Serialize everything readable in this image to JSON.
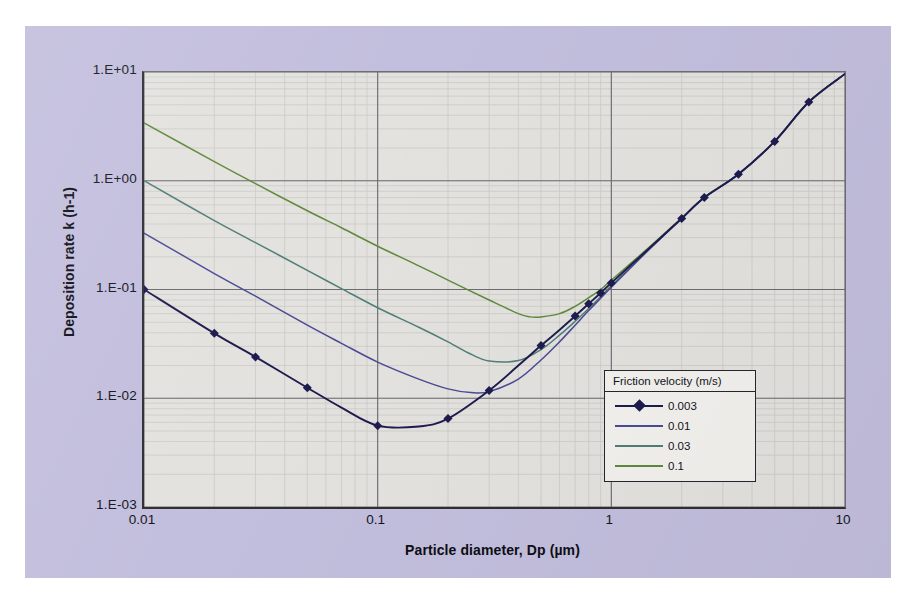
{
  "chart_data": {
    "type": "line",
    "title": "",
    "xlabel": "Particle diameter, Dp (µm)",
    "ylabel": "Deposition rate k (h-1)",
    "xscale": "log",
    "yscale": "log",
    "xlim": [
      0.01,
      10
    ],
    "ylim": [
      0.001,
      10
    ],
    "grid": true,
    "minor_grid": true,
    "legend_position": "inside-lower-right",
    "legend_title": "Friction velocity (m/s)",
    "x_tick_labels": [
      "0.01",
      "0.1",
      "1",
      "10"
    ],
    "x_tick_values": [
      0.01,
      0.1,
      1,
      10
    ],
    "y_tick_labels": [
      "1.E+01",
      "1.E+00",
      "1.E-01",
      "1.E-02",
      "1.E-03"
    ],
    "y_tick_values": [
      10,
      1,
      0.1,
      0.01,
      0.001
    ],
    "series": [
      {
        "name": "0.003",
        "color": "#1e1b4e",
        "marker": "diamond",
        "marker_size": 9,
        "x": [
          0.01,
          0.02,
          0.03,
          0.05,
          0.07,
          0.1,
          0.15,
          0.2,
          0.3,
          0.4,
          0.5,
          0.6,
          0.7,
          0.8,
          0.9,
          1.0,
          1.5,
          2.0,
          2.5,
          3.5,
          5.0,
          7.0,
          10.0
        ],
        "y": [
          0.1,
          0.0395,
          0.024,
          0.0125,
          0.0082,
          0.0056,
          0.0055,
          0.0065,
          0.0118,
          0.02,
          0.0305,
          0.0425,
          0.057,
          0.074,
          0.093,
          0.115,
          0.255,
          0.45,
          0.7,
          1.15,
          2.3,
          5.3,
          9.6
        ],
        "marker_x": [
          0.01,
          0.02,
          0.03,
          0.05,
          0.1,
          0.2,
          0.3,
          0.5,
          0.7,
          0.8,
          0.9,
          1.0,
          2.0,
          2.5,
          3.5,
          5.0,
          7.0
        ],
        "marker_y": [
          0.1,
          0.0395,
          0.024,
          0.0125,
          0.0056,
          0.0065,
          0.0118,
          0.0305,
          0.057,
          0.074,
          0.093,
          0.115,
          0.45,
          0.7,
          1.15,
          2.3,
          5.3
        ]
      },
      {
        "name": "0.01",
        "color": "#4a4a97",
        "marker": "none",
        "x": [
          0.01,
          0.02,
          0.03,
          0.05,
          0.07,
          0.1,
          0.15,
          0.2,
          0.25,
          0.3,
          0.4,
          0.5,
          0.6,
          0.7,
          0.8,
          0.9,
          1.0,
          1.5,
          2.0,
          2.5,
          3.5,
          5.0,
          7.0,
          10.0
        ],
        "y": [
          0.33,
          0.14,
          0.087,
          0.047,
          0.032,
          0.0215,
          0.015,
          0.0122,
          0.0113,
          0.0115,
          0.015,
          0.0225,
          0.033,
          0.047,
          0.064,
          0.083,
          0.105,
          0.25,
          0.45,
          0.7,
          1.15,
          2.3,
          5.3,
          9.6
        ]
      },
      {
        "name": "0.03",
        "color": "#4f7f78",
        "marker": "none",
        "x": [
          0.01,
          0.02,
          0.03,
          0.05,
          0.07,
          0.1,
          0.15,
          0.2,
          0.25,
          0.3,
          0.4,
          0.5,
          0.6,
          0.7,
          0.8,
          0.9,
          1.0,
          1.5,
          2.0,
          2.5,
          3.5,
          5.0,
          7.0,
          10.0
        ],
        "y": [
          1.0,
          0.43,
          0.27,
          0.15,
          0.102,
          0.068,
          0.045,
          0.033,
          0.0255,
          0.022,
          0.0222,
          0.028,
          0.038,
          0.051,
          0.067,
          0.086,
          0.108,
          0.25,
          0.45,
          0.7,
          1.15,
          2.3,
          5.3,
          9.6
        ]
      },
      {
        "name": "0.1",
        "color": "#5f8a3c",
        "marker": "none",
        "x": [
          0.01,
          0.02,
          0.03,
          0.05,
          0.07,
          0.1,
          0.15,
          0.2,
          0.3,
          0.4,
          0.45,
          0.5,
          0.6,
          0.7,
          0.8,
          0.9,
          1.0,
          1.5,
          2.0,
          2.5,
          3.5,
          5.0,
          7.0,
          10.0
        ],
        "y": [
          3.4,
          1.5,
          0.94,
          0.53,
          0.37,
          0.25,
          0.165,
          0.122,
          0.08,
          0.06,
          0.056,
          0.056,
          0.06,
          0.07,
          0.084,
          0.1,
          0.122,
          0.26,
          0.455,
          0.705,
          1.15,
          2.3,
          5.3,
          9.6
        ]
      }
    ]
  },
  "legend": {
    "title": "Friction velocity (m/s)",
    "entries": [
      {
        "label": "0.003",
        "color": "#1e1b4e",
        "marker": true
      },
      {
        "label": "0.01",
        "color": "#4a4a97",
        "marker": false
      },
      {
        "label": "0.03",
        "color": "#4f7f78",
        "marker": false
      },
      {
        "label": "0.1",
        "color": "#5f8a3c",
        "marker": false
      }
    ]
  },
  "axes": {
    "x_title": "Particle diameter, Dp (µm)",
    "y_title": "Deposition rate k (h-1)",
    "y_ticks": [
      "1.E+01",
      "1.E+00",
      "1.E-01",
      "1.E-02",
      "1.E-03"
    ],
    "x_ticks": [
      "0.01",
      "0.1",
      "1",
      "10"
    ]
  },
  "colors": {
    "chart_background": "#c2bedd",
    "plot_background": "#e3e2de",
    "axis_line": "#2e2e33",
    "major_grid": "#6b6b70",
    "minor_grid": "#cbcac6",
    "page_background": "#ffffff"
  }
}
